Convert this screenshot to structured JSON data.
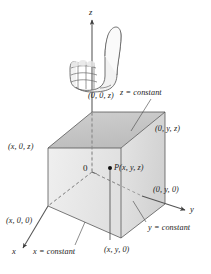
{
  "figure": {
    "background_color": "#ffffff",
    "line_color": "#3d3d3d",
    "text_color": "#1a1a1a"
  },
  "axes": {
    "z_label": "z",
    "y_label": "y",
    "x_label": "x",
    "origin_label": "0"
  },
  "point": {
    "label": "P(x, y, z)"
  },
  "vertex_labels": {
    "top_z": "(0, 0, z)",
    "top_back_right": "(0, y, z)",
    "top_left": "(x, 0, z)",
    "y_intercept": "(0, y, 0)",
    "x_intercept": "(x, 0, 0)",
    "bottom_front": "(x, y, 0)"
  },
  "plane_labels": {
    "z_plane": "z = constant",
    "y_plane": "y = constant",
    "x_plane": "x = constant"
  },
  "hand": {
    "name": "right-hand-thumbs-up",
    "description": "Right hand in a fist with thumb pointing up along the z-axis"
  },
  "colors": {
    "top_face": "#c9c9c9",
    "left_face": "#e8e8e8",
    "front_face": "#dcdcdc",
    "stroke": "#4a4a4a",
    "dashed": "#7a7a7a",
    "point_fill": "#000000"
  }
}
